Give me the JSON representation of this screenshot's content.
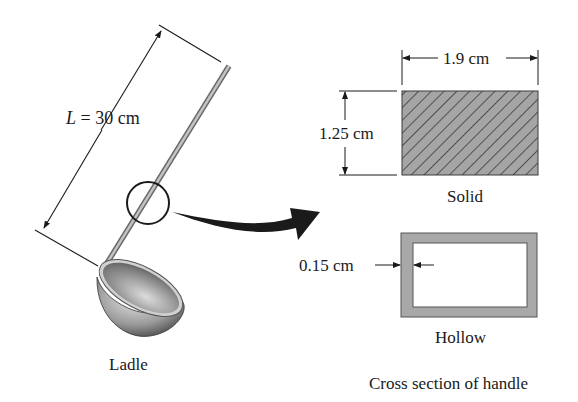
{
  "figure": {
    "ladle": {
      "length_label_var": "L",
      "length_label_rest": " = 30 cm",
      "caption": "Ladle"
    },
    "solid": {
      "width_label": "1.9 cm",
      "height_label": "1.25 cm",
      "caption": "Solid"
    },
    "hollow": {
      "thickness_label": "0.15 cm",
      "caption": "Hollow"
    },
    "caption": "Cross section of handle"
  },
  "colors": {
    "ink": "#1a1a1a",
    "hatch_fill": "#9a9a9a",
    "hollow_fill": "#a8a8a8",
    "handle": "#9c9c9c"
  }
}
